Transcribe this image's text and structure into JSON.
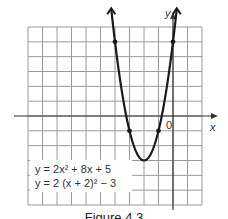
{
  "chart_data": {
    "type": "line",
    "title": "",
    "xlabel": "x",
    "ylabel": "y",
    "origin_label": "0",
    "xlim": [
      -10,
      2
    ],
    "ylim": [
      -6,
      6
    ],
    "grid": true,
    "grid_step": 1,
    "series": [
      {
        "name": "y = 2x^2 + 8x + 5",
        "function": "2*x*x + 8*x + 5",
        "vertex": [
          -2,
          -3
        ],
        "points": [
          [
            -4,
            5
          ],
          [
            -3,
            -1
          ],
          [
            -2,
            -3
          ],
          [
            -1,
            -1
          ],
          [
            0,
            5
          ]
        ],
        "arrows": true
      }
    ],
    "annotations": [
      "y = 2x² + 8x + 5",
      "y = 2 (x + 2)² − 3"
    ]
  },
  "labels": {
    "eq1": "y = 2x² + 8x + 5",
    "eq2": "y = 2 (x + 2)² − 3",
    "x_axis": "x",
    "y_axis": "y",
    "origin": "0",
    "caption": "Figure 4.3"
  },
  "colors": {
    "grid": "#9a9a9a",
    "axis": "#333333",
    "curve": "#1a1a1a",
    "background": "#ffffff"
  }
}
